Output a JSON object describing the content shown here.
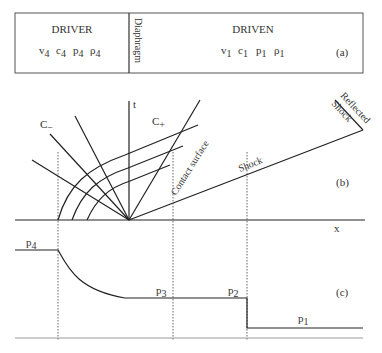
{
  "panel_a": {
    "driver_title": "DRIVER",
    "driver_vars": [
      "v",
      "c",
      "p",
      "ρ"
    ],
    "driver_sub": "4",
    "diaphragm": "Diaphragm",
    "driven_title": "DRIVEN",
    "driven_vars": [
      "v",
      "c",
      "p",
      "ρ"
    ],
    "driven_sub": "1",
    "tag": "(a)"
  },
  "panel_b": {
    "t_axis": "t",
    "x_axis": "x",
    "c_minus": "C",
    "c_minus_sub": "−",
    "c_plus": "C",
    "c_plus_sub": "+",
    "contact": "Contact surface",
    "shock": "Shock",
    "reflected_1": "Reflected",
    "reflected_2": "Shock",
    "tag": "(b)"
  },
  "panel_c": {
    "p4": "p",
    "p4_sub": "4",
    "p3": "p",
    "p3_sub": "3",
    "p2": "p",
    "p2_sub": "2",
    "p1": "p",
    "p1_sub": "1",
    "tag": "(c)"
  }
}
